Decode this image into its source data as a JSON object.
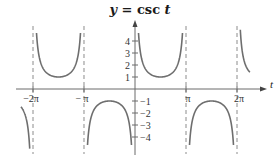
{
  "chart_data": {
    "type": "line",
    "title": "y = csc t",
    "title_parts": {
      "lhs": "y",
      "eq": " = csc ",
      "var": "t"
    },
    "xlabel": "t",
    "ylabel": "",
    "function": "csc",
    "xlim": [
      -7.5,
      8.0
    ],
    "ylim": [
      -5.0,
      5.0
    ],
    "clip_y": 5.0,
    "x_ticks": [
      {
        "value": -6.283185,
        "label": "−2π"
      },
      {
        "value": -3.141593,
        "label": "− π"
      },
      {
        "value": 3.141593,
        "label": "π"
      },
      {
        "value": 6.283185,
        "label": "2π"
      }
    ],
    "y_ticks": [
      {
        "value": 4,
        "label": "4"
      },
      {
        "value": 3,
        "label": "3"
      },
      {
        "value": 2,
        "label": "2"
      },
      {
        "value": 1,
        "label": "1"
      },
      {
        "value": -1,
        "label": "−1"
      },
      {
        "value": -2,
        "label": "−2"
      },
      {
        "value": -3,
        "label": "−3"
      },
      {
        "value": -4,
        "label": "−4"
      }
    ],
    "asymptotes": [
      -6.283185,
      -3.141593,
      3.141593,
      6.283185
    ],
    "asymptote_extent_y": [
      -5.0,
      5.0
    ],
    "branches": [
      {
        "name": "branch-left-partial",
        "t_range": [
          -7.02,
          -6.2832
        ],
        "sign": "negative"
      },
      {
        "name": "branch-minus-2pi-to-minus-pi",
        "t_range": [
          -6.2832,
          -3.1416
        ],
        "sign": "positive",
        "extremum": {
          "t": -4.712389,
          "y": 1
        }
      },
      {
        "name": "branch-minus-pi-to-0",
        "t_range": [
          -3.1416,
          0
        ],
        "sign": "negative",
        "extremum": {
          "t": -1.570796,
          "y": -1
        }
      },
      {
        "name": "branch-0-to-pi",
        "t_range": [
          0,
          3.1416
        ],
        "sign": "positive",
        "extremum": {
          "t": 1.570796,
          "y": 1
        }
      },
      {
        "name": "branch-pi-to-2pi",
        "t_range": [
          3.1416,
          6.2832
        ],
        "sign": "negative",
        "extremum": {
          "t": 4.712389,
          "y": -1
        }
      },
      {
        "name": "branch-right-partial",
        "t_range": [
          6.2832,
          7.08
        ],
        "sign": "positive"
      }
    ],
    "grid": false,
    "legend": "none"
  }
}
